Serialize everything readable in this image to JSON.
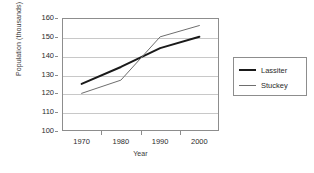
{
  "chart_data": {
    "type": "line",
    "title": "",
    "xlabel": "Year",
    "ylabel": "Population (thousands)",
    "x": [
      1970,
      1980,
      1990,
      2000
    ],
    "xtick_labels": [
      "1970",
      "1980",
      "1990",
      "2000"
    ],
    "ytick_labels": [
      "100",
      "110",
      "120",
      "130",
      "140",
      "150",
      "160"
    ],
    "yticks": [
      100,
      110,
      120,
      130,
      140,
      150,
      160
    ],
    "ylim": [
      100,
      160
    ],
    "xlim": [
      1965,
      2005
    ],
    "grid": "horizontal",
    "legend_position": "right-outside",
    "series": [
      {
        "name": "Lassiter",
        "values": [
          125,
          134,
          144,
          150
        ],
        "color": "#1a1a1a",
        "line_width": 2,
        "swatch": "thick"
      },
      {
        "name": "Stuckey",
        "values": [
          120,
          127,
          150,
          156
        ],
        "color": "#6e6e6e",
        "line_width": 1,
        "swatch": "thin"
      }
    ]
  },
  "legend": {
    "entries": [
      {
        "label": "Lassiter"
      },
      {
        "label": "Stuckey"
      }
    ]
  },
  "colors": {
    "axis": "#8d8d8d",
    "gridline": "#c8c8c8",
    "text": "#2b2b2b",
    "background": "#ffffff",
    "series_lassiter": "#1a1a1a",
    "series_stuckey": "#6e6e6e"
  }
}
